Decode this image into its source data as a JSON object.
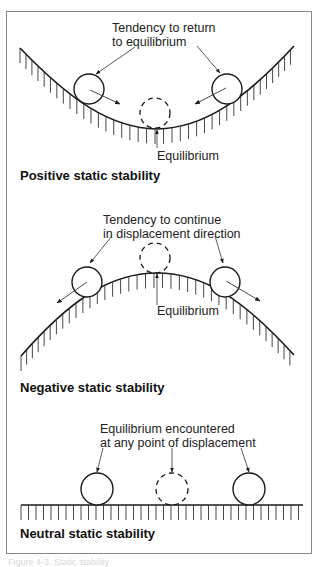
{
  "figure": {
    "caption": "Figure 4-3. Static stability",
    "frame_color": "#8a8a8a",
    "line_color": "#1a1a1a"
  },
  "panels": [
    {
      "id": "positive",
      "title": "Positive static stability",
      "annotation_line1": "Tendency to return",
      "annotation_line2": "to equilibrium",
      "equilibrium_label": "Equilibrium",
      "surface": "concave (valley)",
      "icons": [
        "ball-left",
        "ball-right",
        "ball-equilibrium-dashed",
        "arrow-toward-center"
      ]
    },
    {
      "id": "negative",
      "title": "Negative static stability",
      "annotation_line1": "Tendency to continue",
      "annotation_line2": "in displacement direction",
      "equilibrium_label": "Equilibrium",
      "surface": "convex (hill)",
      "icons": [
        "ball-left",
        "ball-right",
        "ball-equilibrium-dashed",
        "arrow-away-from-center"
      ]
    },
    {
      "id": "neutral",
      "title": "Neutral static stability",
      "annotation_line1": "Equilibrium encountered",
      "annotation_line2": "at any point of displacement",
      "surface": "flat",
      "icons": [
        "ball-left",
        "ball-right",
        "ball-middle-dashed"
      ]
    }
  ]
}
